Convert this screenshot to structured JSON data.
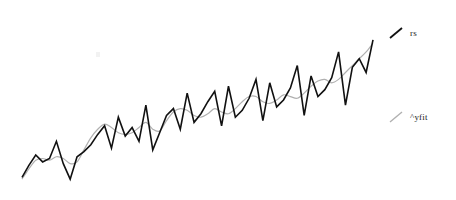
{
  "figure": {
    "background_color": "#ffffff",
    "width": 456,
    "height": 200
  },
  "legend": {
    "position": "right",
    "entries": [
      {
        "key": "rs",
        "label": "rs",
        "color": "#111111",
        "swatch": "diagonal-line-swatch"
      },
      {
        "key": "yfit",
        "label": "^yfit",
        "color": "#b0b0b0",
        "swatch": "diagonal-line-swatch"
      }
    ]
  },
  "chart_data": {
    "type": "line",
    "title": "",
    "subtitle": "",
    "xlabel": "",
    "ylabel": "",
    "grid": false,
    "axes_visible": false,
    "tick_labels": [],
    "legend_position": "right",
    "xlim": [
      0,
      51
    ],
    "ylim": [
      0,
      100
    ],
    "x": [
      0,
      1,
      2,
      3,
      4,
      5,
      6,
      7,
      8,
      9,
      10,
      11,
      12,
      13,
      14,
      15,
      16,
      17,
      18,
      19,
      20,
      21,
      22,
      23,
      24,
      25,
      26,
      27,
      28,
      29,
      30,
      31,
      32,
      33,
      34,
      35,
      36,
      37,
      38,
      39,
      40,
      41,
      42,
      43,
      44,
      45,
      46,
      47,
      48,
      49,
      50,
      51
    ],
    "series": [
      {
        "name": "rs",
        "color": "#111111",
        "line_width": 1.6,
        "style": "solid",
        "values": [
          5,
          12,
          18,
          14,
          16,
          26,
          13,
          4,
          17,
          20,
          24,
          30,
          35,
          22,
          40,
          29,
          34,
          26,
          47,
          21,
          31,
          41,
          45,
          33,
          54,
          37,
          42,
          49,
          55,
          35,
          58,
          40,
          44,
          51,
          62,
          38,
          60,
          46,
          50,
          57,
          70,
          41,
          64,
          52,
          56,
          63,
          78,
          47,
          69,
          74,
          66,
          85
        ]
      },
      {
        "name": "^yfit",
        "color": "#b0b0b0",
        "line_width": 1.2,
        "style": "solid",
        "values": [
          4,
          10,
          15,
          16,
          15,
          17,
          16,
          13,
          14,
          21,
          28,
          33,
          36,
          34,
          31,
          30,
          31,
          34,
          37,
          33,
          32,
          38,
          43,
          45,
          44,
          41,
          40,
          42,
          45,
          43,
          42,
          45,
          49,
          52,
          52,
          49,
          48,
          50,
          53,
          52,
          51,
          54,
          58,
          61,
          62,
          60,
          62,
          66,
          70,
          74,
          78,
          83
        ]
      }
    ]
  }
}
